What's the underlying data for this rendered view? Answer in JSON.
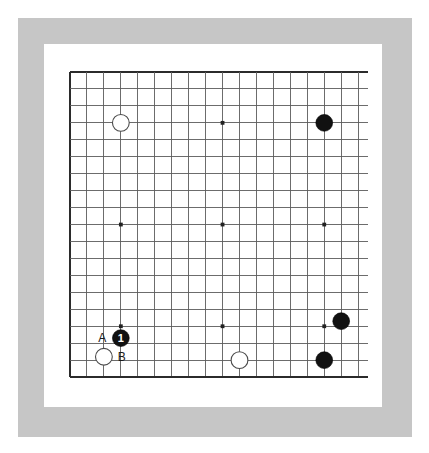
{
  "diagram": {
    "type": "go-board-problem-diagram",
    "board_size": 19,
    "frame": {
      "outer_color": "#c6c6c6",
      "inner_color": "#ffffff",
      "background_color": "#ffffff"
    },
    "grid": {
      "line_color": "#5c5c5c",
      "border_color": "#2b2b2b",
      "origin_x": 8,
      "origin_y": 8,
      "spacing": 16.95,
      "lines": 19
    },
    "star_points": [
      {
        "col": 3,
        "row": 3
      },
      {
        "col": 9,
        "row": 3
      },
      {
        "col": 15,
        "row": 3
      },
      {
        "col": 3,
        "row": 9
      },
      {
        "col": 9,
        "row": 9
      },
      {
        "col": 15,
        "row": 9
      },
      {
        "col": 3,
        "row": 15
      },
      {
        "col": 9,
        "row": 15
      },
      {
        "col": 15,
        "row": 15
      }
    ],
    "stones": [
      {
        "id": "w-upper-left",
        "color": "white",
        "col": 3,
        "row": 3,
        "radius": 8.4,
        "number": ""
      },
      {
        "id": "b-upper-right",
        "color": "black",
        "col": 15,
        "row": 3,
        "radius": 8.4,
        "number": ""
      },
      {
        "id": "b-right-upper",
        "color": "black",
        "col": 16,
        "row": 14.7,
        "radius": 8.4,
        "number": ""
      },
      {
        "id": "b-right-lower",
        "color": "black",
        "col": 15,
        "row": 17,
        "radius": 8.4,
        "number": ""
      },
      {
        "id": "w-bottom-mid",
        "color": "white",
        "col": 10,
        "row": 17,
        "radius": 8.4,
        "number": ""
      },
      {
        "id": "b-move-one",
        "color": "black",
        "col": 3,
        "row": 15.7,
        "radius": 8.4,
        "number": "1"
      },
      {
        "id": "w-bottom-left",
        "color": "white",
        "col": 2,
        "row": 16.8,
        "radius": 8.4,
        "number": ""
      }
    ],
    "labels": [
      {
        "id": "label-a",
        "text": "A",
        "col": 1.9,
        "row": 15.7
      },
      {
        "id": "label-b",
        "text": "B",
        "col": 3.05,
        "row": 16.8
      }
    ]
  }
}
